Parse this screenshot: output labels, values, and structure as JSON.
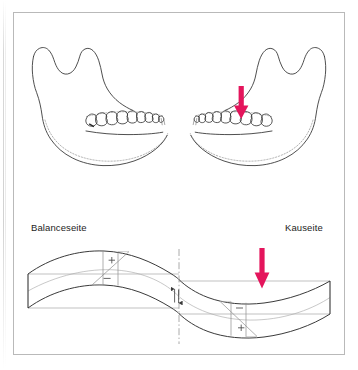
{
  "figure": {
    "title_visible": false,
    "kind": "mandible-bending-stress-diagram",
    "background_color": "#ffffff",
    "border_color": "#b9b9b9",
    "line_color": "#2b2b2b",
    "dotted_line_color": "#8a8a8a",
    "thin_line_color": "#9a9a9a",
    "arrow_color": "#e4155c",
    "arrow_color_alt": "#d81b60"
  },
  "labels": {
    "balance_side": "Balanceseite",
    "chewing_side": "Kauseite"
  },
  "signs": {
    "upper_left": "+",
    "lower_left": "−",
    "upper_right": "−",
    "lower_right": "+"
  },
  "annotations": {
    "load_arrow_jaw": "load-arrow-on-molar",
    "load_arrow_beam": "load-arrow-on-beam",
    "centerline": "dash-dot-symmetry-axis",
    "deflection_marks": "neutral-axis-shift-arrows"
  },
  "icons": {
    "arrow_down": "arrow-down-icon",
    "plus": "plus-sign-icon",
    "minus": "minus-sign-icon"
  }
}
